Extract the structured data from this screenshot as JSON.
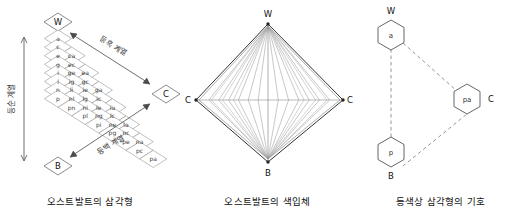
{
  "figure": {
    "panels": [
      {
        "id": "ostwald-triangle",
        "caption": "오스트발트의 삼각형",
        "vertices": {
          "top": "W",
          "bottom": "B",
          "right": "C"
        },
        "axis_labels": {
          "vertical": "등순 계열",
          "upper_diagonal": "등흑 계열",
          "lower_diagonal": "등백 계열"
        },
        "grid_rows": [
          [
            "a"
          ],
          [
            "c",
            "ca"
          ],
          [
            "e",
            "ec",
            "ea"
          ],
          [
            "g",
            "ge",
            "gc",
            "ga"
          ],
          [
            "i",
            "ig",
            "ie",
            "ic",
            "ia"
          ],
          [
            "l",
            "li",
            "lg",
            "le",
            "lc",
            "la"
          ],
          [
            "n",
            "nl",
            "ni",
            "ng",
            "ne",
            "nc",
            "na"
          ],
          [
            "p",
            "pn",
            "pl",
            "pi",
            "pg",
            "pe",
            "pc",
            "pa"
          ]
        ]
      },
      {
        "id": "ostwald-color-solid",
        "caption": "오스트발트의 색입체",
        "vertices": {
          "top": "W",
          "bottom": "B",
          "left": "C",
          "right": "C"
        }
      },
      {
        "id": "equal-hue-triangle-symbols",
        "caption": "등색상 삼각형의 기호",
        "nodes": [
          {
            "symbol": "a",
            "vertex": "W",
            "position": "top"
          },
          {
            "symbol": "p",
            "vertex": "B",
            "position": "bottom"
          },
          {
            "symbol": "pa",
            "vertex": "C",
            "position": "right"
          }
        ]
      }
    ],
    "colors": {
      "ink": "#1a1a1a",
      "line": "#555555",
      "grid_line": "#7a7a7a",
      "background": "#ffffff"
    }
  }
}
